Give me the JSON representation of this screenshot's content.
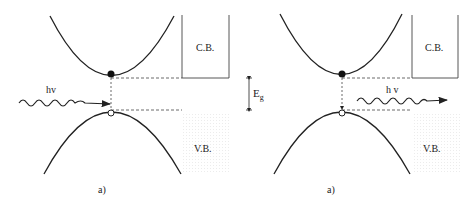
{
  "panels": [
    {
      "caption": "a)",
      "cb_label": "C.B.",
      "vb_label": "V.B.",
      "photon_label": "hv",
      "process": "absorption"
    },
    {
      "caption": "a)",
      "cb_label": "C.B.",
      "vb_label": "V.B.",
      "photon_label": "h v",
      "process": "emission"
    }
  ],
  "gap_label": {
    "main": "E",
    "sub": "g"
  }
}
